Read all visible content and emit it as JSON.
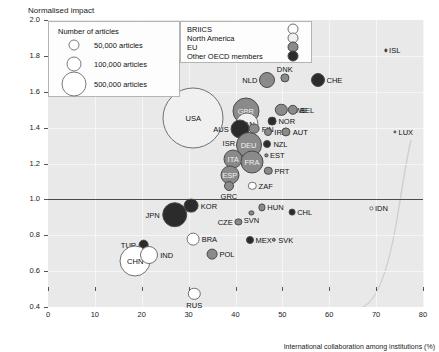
{
  "chart_data": {
    "type": "scatter",
    "title": "",
    "ylabel": "Normalised impact",
    "xlabel": "International collaboration among institutions (%)",
    "xlim": [
      0,
      80
    ],
    "ylim": [
      0.4,
      2.0
    ],
    "xticks": [
      0,
      10,
      20,
      30,
      40,
      50,
      60,
      70,
      80
    ],
    "yticks": [
      0.4,
      0.6,
      0.8,
      1.0,
      1.2,
      1.4,
      1.6,
      1.8,
      2.0
    ],
    "grid": true,
    "reference_line_y": 1.0,
    "bubble_size_meaning": "Number of articles",
    "size_legend": {
      "title": "Number of articles",
      "items": [
        {
          "label": "50,000 articles",
          "value": 50000
        },
        {
          "label": "100,000 articles",
          "value": 100000
        },
        {
          "label": "500,000 articles",
          "value": 500000
        }
      ]
    },
    "category_legend": {
      "items": [
        {
          "label": "BRIICS",
          "color": "#ffffff"
        },
        {
          "label": "North America",
          "color": "#f0f0f0"
        },
        {
          "label": "EU",
          "color": "#8a8a8a"
        },
        {
          "label": "Other OECD members",
          "color": "#2b2b2b"
        }
      ]
    },
    "points": [
      {
        "code": "ISL",
        "x": 72.0,
        "y": 1.83,
        "r": 1.6,
        "group": "Other OECD members",
        "lab": "right"
      },
      {
        "code": "NLD",
        "x": 46.8,
        "y": 1.665,
        "r": 8.0,
        "group": "EU",
        "lab": "left"
      },
      {
        "code": "DNK",
        "x": 50.5,
        "y": 1.675,
        "r": 4.6,
        "group": "EU",
        "lab": "top"
      },
      {
        "code": "CHE",
        "x": 57.5,
        "y": 1.665,
        "r": 7.0,
        "group": "Other OECD members",
        "lab": "right"
      },
      {
        "code": "USA",
        "x": 31.0,
        "y": 1.455,
        "r": 30.5,
        "group": "North America",
        "lab": "center"
      },
      {
        "code": "GBR",
        "x": 42.2,
        "y": 1.49,
        "r": 13.5,
        "group": "EU",
        "lab": "center"
      },
      {
        "code": "SWE",
        "x": 49.8,
        "y": 1.5,
        "r": 6.2,
        "group": "EU",
        "lab": "right"
      },
      {
        "code": "BEL",
        "x": 52.2,
        "y": 1.5,
        "r": 5.2,
        "group": "EU",
        "lab": "right"
      },
      {
        "code": "NOR",
        "x": 47.8,
        "y": 1.435,
        "r": 4.4,
        "group": "Other OECD members",
        "lab": "right"
      },
      {
        "code": "CAN",
        "x": 42.4,
        "y": 1.42,
        "r": 11.5,
        "group": "North America",
        "lab": "center"
      },
      {
        "code": "AUS",
        "x": 41.0,
        "y": 1.395,
        "r": 9.5,
        "group": "Other OECD members",
        "lab": "left"
      },
      {
        "code": "FIN",
        "x": 44.0,
        "y": 1.395,
        "r": 5.4,
        "group": "EU",
        "lab": "right"
      },
      {
        "code": "IRL",
        "x": 47.0,
        "y": 1.375,
        "r": 4.0,
        "group": "EU",
        "lab": "right"
      },
      {
        "code": "AUT",
        "x": 50.8,
        "y": 1.375,
        "r": 4.6,
        "group": "EU",
        "lab": "right"
      },
      {
        "code": "LUX",
        "x": 74.0,
        "y": 1.375,
        "r": 1.6,
        "group": "EU",
        "lab": "right"
      },
      {
        "code": "ISR",
        "x": 41.5,
        "y": 1.315,
        "r": 5.4,
        "group": "Other OECD members",
        "lab": "left"
      },
      {
        "code": "DEU",
        "x": 42.8,
        "y": 1.305,
        "r": 13.0,
        "group": "EU",
        "lab": "center"
      },
      {
        "code": "NZL",
        "x": 46.8,
        "y": 1.31,
        "r": 4.0,
        "group": "Other OECD members",
        "lab": "right"
      },
      {
        "code": "EST",
        "x": 46.6,
        "y": 1.245,
        "r": 1.6,
        "group": "EU",
        "lab": "right"
      },
      {
        "code": "ITA",
        "x": 39.5,
        "y": 1.225,
        "r": 9.5,
        "group": "EU",
        "lab": "center"
      },
      {
        "code": "FRA",
        "x": 43.5,
        "y": 1.21,
        "r": 11.5,
        "group": "EU",
        "lab": "center"
      },
      {
        "code": "PRT",
        "x": 47.0,
        "y": 1.16,
        "r": 4.2,
        "group": "EU",
        "lab": "right"
      },
      {
        "code": "ESP",
        "x": 38.8,
        "y": 1.135,
        "r": 9.5,
        "group": "EU",
        "lab": "center"
      },
      {
        "code": "GRC",
        "x": 38.6,
        "y": 1.075,
        "r": 5.0,
        "group": "EU",
        "lab": "bottom"
      },
      {
        "code": "ZAF",
        "x": 43.6,
        "y": 1.075,
        "r": 4.2,
        "group": "BRIICS",
        "lab": "right"
      },
      {
        "code": "KOR",
        "x": 30.6,
        "y": 0.965,
        "r": 7.4,
        "group": "Other OECD members",
        "lab": "right"
      },
      {
        "code": "HUN",
        "x": 45.6,
        "y": 0.955,
        "r": 3.6,
        "group": "EU",
        "lab": "right"
      },
      {
        "code": "IDN",
        "x": 69.0,
        "y": 0.95,
        "r": 1.6,
        "group": "BRIICS",
        "lab": "right"
      },
      {
        "code": "SVN",
        "x": 43.4,
        "y": 0.925,
        "r": 2.6,
        "group": "EU",
        "lab": "bottom"
      },
      {
        "code": "CHL",
        "x": 52.0,
        "y": 0.93,
        "r": 3.4,
        "group": "Other OECD members",
        "lab": "right"
      },
      {
        "code": "JPN",
        "x": 27.0,
        "y": 0.915,
        "r": 12.8,
        "group": "Other OECD members",
        "lab": "left"
      },
      {
        "code": "CZE",
        "x": 40.6,
        "y": 0.875,
        "r": 3.6,
        "group": "EU",
        "lab": "left"
      },
      {
        "code": "MEX",
        "x": 43.0,
        "y": 0.775,
        "r": 4.0,
        "group": "Other OECD members",
        "lab": "right"
      },
      {
        "code": "SVK",
        "x": 48.2,
        "y": 0.775,
        "r": 2.2,
        "group": "EU",
        "lab": "right"
      },
      {
        "code": "TUR",
        "x": 20.4,
        "y": 0.745,
        "r": 5.4,
        "group": "Other OECD members",
        "lab": "left"
      },
      {
        "code": "BRA",
        "x": 31.0,
        "y": 0.78,
        "r": 6.4,
        "group": "BRIICS",
        "lab": "right"
      },
      {
        "code": "POL",
        "x": 35.0,
        "y": 0.695,
        "r": 5.4,
        "group": "EU",
        "lab": "right"
      },
      {
        "code": "CHN",
        "x": 18.6,
        "y": 0.655,
        "r": 15.5,
        "group": "BRIICS",
        "lab": "center"
      },
      {
        "code": "IND",
        "x": 21.6,
        "y": 0.69,
        "r": 9.0,
        "group": "BRIICS",
        "lab": "right"
      },
      {
        "code": "RUS",
        "x": 31.2,
        "y": 0.475,
        "r": 6.2,
        "group": "BRIICS",
        "lab": "bottom"
      }
    ]
  }
}
